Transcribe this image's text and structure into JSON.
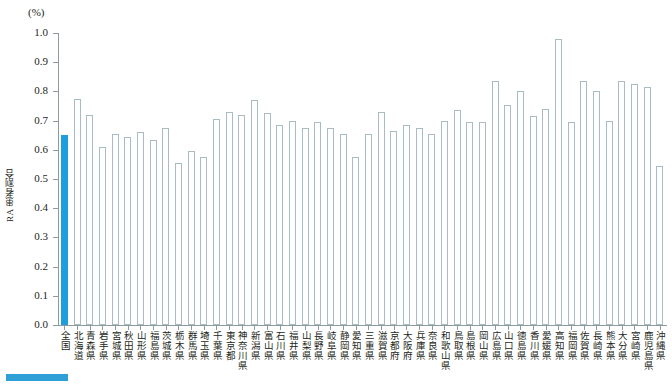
{
  "chart_data": {
    "type": "bar",
    "title": "",
    "subtitle": "",
    "unit_label": "(%)",
    "xlabel": "",
    "ylabel": "RA 患者割合",
    "ylim": [
      0.0,
      1.0
    ],
    "grid": false,
    "legend_position": "bottom-left",
    "ytick_labels": [
      "1.0",
      "0.9",
      "0.8",
      "0.7",
      "0.6",
      "0.5",
      "0.4",
      "0.3",
      "0.2",
      "0.1",
      "0.0"
    ],
    "ytick_values": [
      1.0,
      0.9,
      0.8,
      0.7,
      0.6,
      0.5,
      0.4,
      0.3,
      0.2,
      0.1,
      0.0
    ],
    "highlight_index": 0,
    "highlight_color": "#1e9fdc",
    "bar_color": "#ffffff",
    "bar_border_color": "#a9bcc2",
    "categories": [
      "全国",
      "北海道",
      "青森県",
      "岩手県",
      "宮城県",
      "秋田県",
      "山形県",
      "福島県",
      "茨城県",
      "栃木県",
      "群馬県",
      "埼玉県",
      "千葉県",
      "東京都",
      "神奈川県",
      "新潟県",
      "富山県",
      "石川県",
      "福井県",
      "山梨県",
      "長野県",
      "岐阜県",
      "静岡県",
      "愛知県",
      "三重県",
      "滋賀県",
      "京都府",
      "大阪府",
      "兵庫県",
      "奈良県",
      "和歌山県",
      "鳥取県",
      "島根県",
      "岡山県",
      "広島県",
      "山口県",
      "徳島県",
      "香川県",
      "愛媛県",
      "高知県",
      "福岡県",
      "佐賀県",
      "長崎県",
      "熊本県",
      "大分県",
      "宮崎県",
      "鹿児島県",
      "沖縄県"
    ],
    "values": [
      0.65,
      0.775,
      0.72,
      0.61,
      0.655,
      0.645,
      0.66,
      0.635,
      0.675,
      0.555,
      0.595,
      0.575,
      0.705,
      0.73,
      0.72,
      0.77,
      0.725,
      0.685,
      0.7,
      0.675,
      0.695,
      0.675,
      0.655,
      0.575,
      0.655,
      0.73,
      0.665,
      0.685,
      0.675,
      0.655,
      0.7,
      0.735,
      0.695,
      0.695,
      0.835,
      0.755,
      0.8,
      0.715,
      0.74,
      0.98,
      0.695,
      0.835,
      0.8,
      0.7,
      0.835,
      0.825,
      0.815,
      0.545
    ]
  },
  "legend": {
    "label": ""
  }
}
